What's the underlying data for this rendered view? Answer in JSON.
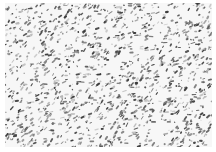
{
  "image": {
    "description": "Grayscale micrograph-like texture: white field densely covered with dark gray elongated speckles and streaks oriented mostly diagonally",
    "width": 216,
    "height": 152,
    "content_region": {
      "x": 5,
      "y": 3,
      "width": 207,
      "height": 144
    },
    "colors": {
      "background": "#ffffff",
      "field": "#f7f7f7",
      "speckle_dark": "#3a3a3a",
      "speckle_mid": "#7a7a7a",
      "speckle_light": "#b5b5b5"
    },
    "pattern": {
      "speckle_count": 1400,
      "dominant_angle_deg": -30,
      "seed": 7
    }
  }
}
